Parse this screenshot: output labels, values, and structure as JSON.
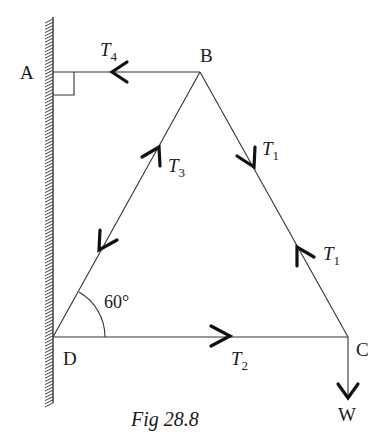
{
  "figure": {
    "caption": "Fig 28.8",
    "points": {
      "A": {
        "label": "A"
      },
      "B": {
        "label": "B"
      },
      "C": {
        "label": "C"
      },
      "D": {
        "label": "D"
      }
    },
    "forces": {
      "T4": {
        "base": "T",
        "sub": "4"
      },
      "T3": {
        "base": "T",
        "sub": "3"
      },
      "T1_upper": {
        "base": "T",
        "sub": "1"
      },
      "T1_lower": {
        "base": "T",
        "sub": "1"
      },
      "T2": {
        "base": "T",
        "sub": "2"
      },
      "W": {
        "label": "W"
      }
    },
    "angle": {
      "label": "60°"
    }
  }
}
